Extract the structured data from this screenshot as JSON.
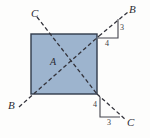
{
  "figure": {
    "name": "square-plate-cable-diagram",
    "background_color": "#fdfdfc",
    "plate": {
      "label": "A",
      "fill_color": "#9db4ce",
      "edge_color": "#2f3a4a",
      "x": 31,
      "y": 34,
      "width": 66,
      "height": 60
    },
    "line_color": "#33333b",
    "cables": [
      {
        "name": "cable-B",
        "label_start": "B",
        "label_end": "B",
        "style": "dashed"
      },
      {
        "name": "cable-C",
        "label_start": "C",
        "label_end": "C",
        "style": "dashed"
      }
    ],
    "labels": {
      "c_top_left": "C",
      "b_top_right": "B",
      "b_bottom_left": "B",
      "c_bottom_right": "C",
      "plate_center": "A"
    },
    "slope_triangles": [
      {
        "name": "slope-triangle-top-right",
        "vertical": "3",
        "horizontal": "4"
      },
      {
        "name": "slope-triangle-bottom-right",
        "vertical": "4",
        "horizontal": "3"
      }
    ]
  }
}
